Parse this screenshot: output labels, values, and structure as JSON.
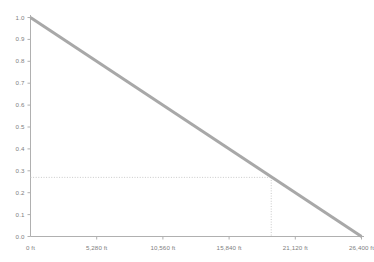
{
  "chart_data": {
    "type": "line",
    "title": "",
    "subtitle": "",
    "xlabel": "",
    "ylabel": "",
    "xlim": [
      0,
      26400
    ],
    "ylim": [
      0,
      1.0
    ],
    "grid": false,
    "legend": null,
    "x_unit": "ft",
    "x_tick_values": [
      0,
      5280,
      10560,
      15840,
      21120,
      26400
    ],
    "x_tick_labels": [
      "0 ft",
      "5,280 ft",
      "10,560 ft",
      "15,840 ft",
      "21,120 ft",
      "26,400 ft"
    ],
    "y_tick_values": [
      0.0,
      0.1,
      0.2,
      0.3,
      0.4,
      0.5,
      0.6,
      0.7,
      0.8,
      0.9,
      1.0
    ],
    "y_tick_labels": [
      "0.0",
      "0.1",
      "0.2",
      "0.3",
      "0.4",
      "0.5",
      "0.6",
      "0.7",
      "0.8",
      "0.9",
      "1.0"
    ],
    "series": [
      {
        "name": "decay",
        "color": "#a8a8a8",
        "line_width": 3,
        "x": [
          0,
          26400
        ],
        "values": [
          1.0,
          0.0
        ]
      }
    ],
    "annotations": [
      {
        "type": "reference-lines",
        "name": "intersection-guide",
        "x": 19200,
        "y": 0.27,
        "style": "dotted",
        "color": "#c8c8c8"
      }
    ],
    "axis_color": "#b0b0b0",
    "tick_color": "#b0b0b0",
    "label_color": "#808080",
    "background": "#ffffff"
  }
}
